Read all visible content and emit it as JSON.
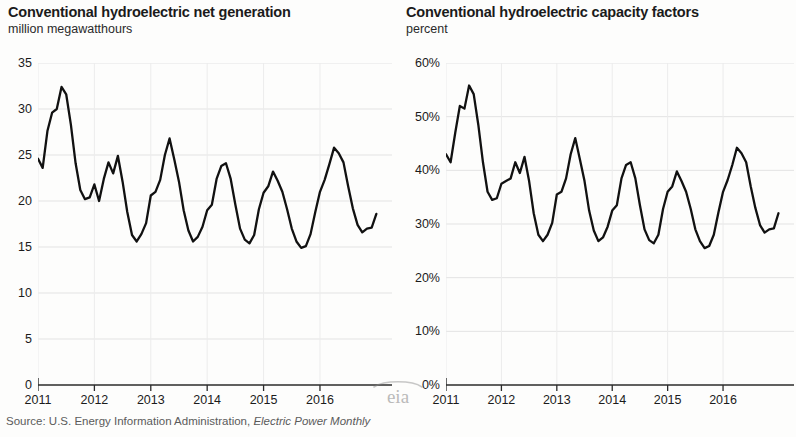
{
  "source": {
    "prefix": "Source: U.S. Energy Information Administration, ",
    "publication": "Electric Power Monthly"
  },
  "logo": {
    "text": "eia",
    "name": "eia-watermark-logo"
  },
  "chart_data": [
    {
      "type": "line",
      "panel": "left",
      "title": "Conventional hydroelectric net generation",
      "subtitle": "million megawatthours",
      "xlabel": "",
      "ylabel": "million megawatthours",
      "ylim": [
        0,
        35
      ],
      "yticks": [
        0,
        5,
        10,
        15,
        20,
        25,
        30,
        35
      ],
      "yticklabels": [
        "0",
        "5",
        "10",
        "15",
        "20",
        "25",
        "30",
        "35"
      ],
      "xticks": [
        2011,
        2012,
        2013,
        2014,
        2015,
        2016
      ],
      "xticklabels": [
        "2011",
        "2012",
        "2013",
        "2014",
        "2015",
        "2016"
      ],
      "xlim": [
        2011.0,
        2017.1
      ],
      "grid": true,
      "line_color": "#111111",
      "series": [
        {
          "name": "Conventional hydroelectric net generation",
          "x": [
            2011.0,
            2011.083,
            2011.167,
            2011.25,
            2011.333,
            2011.417,
            2011.5,
            2011.583,
            2011.667,
            2011.75,
            2011.833,
            2011.917,
            2012.0,
            2012.083,
            2012.167,
            2012.25,
            2012.333,
            2012.417,
            2012.5,
            2012.583,
            2012.667,
            2012.75,
            2012.833,
            2012.917,
            2013.0,
            2013.083,
            2013.167,
            2013.25,
            2013.333,
            2013.417,
            2013.5,
            2013.583,
            2013.667,
            2013.75,
            2013.833,
            2013.917,
            2014.0,
            2014.083,
            2014.167,
            2014.25,
            2014.333,
            2014.417,
            2014.5,
            2014.583,
            2014.667,
            2014.75,
            2014.833,
            2014.917,
            2015.0,
            2015.083,
            2015.167,
            2015.25,
            2015.333,
            2015.417,
            2015.5,
            2015.583,
            2015.667,
            2015.75,
            2015.833,
            2015.917,
            2016.0,
            2016.083,
            2016.167,
            2016.25,
            2016.333,
            2016.417,
            2016.5,
            2016.583,
            2016.667,
            2016.75,
            2016.833,
            2016.917,
            2017.0
          ],
          "values": [
            24.6,
            23.6,
            27.6,
            29.6,
            30.0,
            32.4,
            31.6,
            28.3,
            24.1,
            21.2,
            20.2,
            20.4,
            21.8,
            20.0,
            22.4,
            24.2,
            23.0,
            24.9,
            22.1,
            18.8,
            16.3,
            15.6,
            16.4,
            17.6,
            20.6,
            21.0,
            22.3,
            25.0,
            26.8,
            24.5,
            22.1,
            19.0,
            16.8,
            15.6,
            16.1,
            17.2,
            19.0,
            19.6,
            22.4,
            23.8,
            24.1,
            22.4,
            19.6,
            17.0,
            15.8,
            15.4,
            16.3,
            19.1,
            20.9,
            21.6,
            23.2,
            22.2,
            21.0,
            19.1,
            17.0,
            15.6,
            14.9,
            15.1,
            16.4,
            18.8,
            21.0,
            22.3,
            24.0,
            25.8,
            25.2,
            24.2,
            21.6,
            19.2,
            17.4,
            16.6,
            17.0,
            17.1,
            18.6
          ]
        }
      ]
    },
    {
      "type": "line",
      "panel": "right",
      "title": "Conventional hydroelectric capacity factors",
      "subtitle": "percent",
      "xlabel": "",
      "ylabel": "percent",
      "ylim": [
        0,
        60
      ],
      "yticks": [
        0,
        10,
        20,
        30,
        40,
        50,
        60
      ],
      "yticklabels": [
        "0%",
        "10%",
        "20%",
        "30%",
        "40%",
        "50%",
        "60%"
      ],
      "xticks": [
        2011,
        2012,
        2013,
        2014,
        2015,
        2016
      ],
      "xticklabels": [
        "2011",
        "2012",
        "2013",
        "2014",
        "2015",
        "2016"
      ],
      "xlim": [
        2011.0,
        2017.1
      ],
      "grid": true,
      "line_color": "#111111",
      "series": [
        {
          "name": "Conventional hydroelectric capacity factors",
          "x": [
            2011.0,
            2011.083,
            2011.167,
            2011.25,
            2011.333,
            2011.417,
            2011.5,
            2011.583,
            2011.667,
            2011.75,
            2011.833,
            2011.917,
            2012.0,
            2012.083,
            2012.167,
            2012.25,
            2012.333,
            2012.417,
            2012.5,
            2012.583,
            2012.667,
            2012.75,
            2012.833,
            2012.917,
            2013.0,
            2013.083,
            2013.167,
            2013.25,
            2013.333,
            2013.417,
            2013.5,
            2013.583,
            2013.667,
            2013.75,
            2013.833,
            2013.917,
            2014.0,
            2014.083,
            2014.167,
            2014.25,
            2014.333,
            2014.417,
            2014.5,
            2014.583,
            2014.667,
            2014.75,
            2014.833,
            2014.917,
            2015.0,
            2015.083,
            2015.167,
            2015.25,
            2015.333,
            2015.417,
            2015.5,
            2015.583,
            2015.667,
            2015.75,
            2015.833,
            2015.917,
            2016.0,
            2016.083,
            2016.167,
            2016.25,
            2016.333,
            2016.417,
            2016.5,
            2016.583,
            2016.667,
            2016.75,
            2016.833,
            2016.917,
            2017.0
          ],
          "values": [
            43.0,
            41.5,
            47.0,
            52.0,
            51.5,
            55.8,
            54.2,
            48.5,
            41.5,
            36.0,
            34.5,
            34.8,
            37.5,
            38.0,
            38.5,
            41.5,
            39.5,
            42.5,
            38.0,
            32.0,
            28.0,
            26.8,
            28.0,
            30.2,
            35.5,
            36.0,
            38.5,
            43.0,
            46.0,
            42.0,
            38.0,
            32.5,
            28.8,
            26.8,
            27.5,
            29.5,
            32.5,
            33.5,
            38.5,
            41.0,
            41.5,
            38.5,
            33.5,
            29.0,
            27.0,
            26.4,
            28.0,
            32.8,
            36.0,
            37.0,
            39.8,
            38.0,
            36.0,
            32.8,
            29.0,
            26.8,
            25.5,
            25.9,
            28.0,
            32.2,
            36.0,
            38.2,
            41.0,
            44.2,
            43.2,
            41.5,
            37.0,
            33.0,
            29.8,
            28.4,
            29.0,
            29.2,
            32.0
          ]
        }
      ]
    }
  ]
}
